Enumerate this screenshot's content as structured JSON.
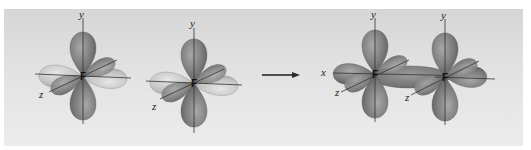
{
  "figure": {
    "colors": {
      "background_top": "#d6d6d6",
      "background_bottom": "#ececec",
      "lobe_dark": "#7a7a7a",
      "lobe_light": "#c4c4c4",
      "axis": "#333333",
      "arrow": "#2a2a2a"
    },
    "left_atom_1": {
      "atom_label": "F",
      "axis_y": "y",
      "axis_z": "z"
    },
    "left_atom_2": {
      "atom_label": "F",
      "axis_y": "y",
      "axis_z": "z"
    },
    "arrow": {
      "direction": "right"
    },
    "molecule": {
      "atom_1": {
        "atom_label": "F",
        "axis_x": "x",
        "axis_y": "y",
        "axis_z": "z"
      },
      "atom_2": {
        "atom_label": "F",
        "axis_y": "y",
        "axis_z": "z"
      }
    }
  }
}
